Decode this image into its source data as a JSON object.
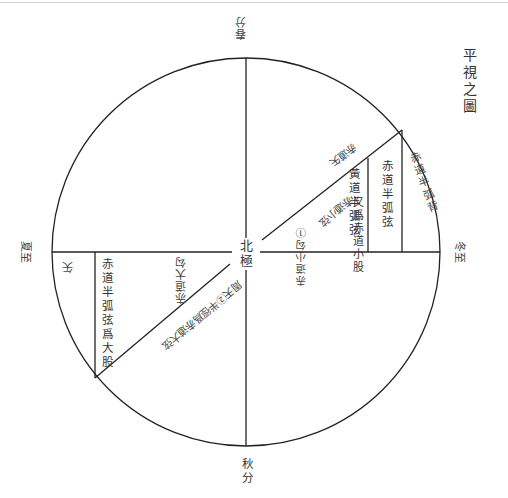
{
  "title": "平視之圖",
  "cardinal": {
    "top": "春分",
    "bottom": "秋分",
    "left": "夏至",
    "right": "冬至"
  },
  "center_label": "北極",
  "labels": {
    "chidao_banhu_bei": "赤道半弧背",
    "chidao_banhu_xian": "赤道半弧弦",
    "huangdao_banhu_xian": "黃道半弧弦",
    "you_wei_chidao_xiao_gu": "又爲赤道小股",
    "chidao_xiao_gou": "赤道小勾①",
    "chidao_xiao_xian": "赤道小弦",
    "shi_top": "赤道矢",
    "shi_left": "矢",
    "chidao_banhu_xian_wei_da_gu": "赤道半弧弦爲大股",
    "chidao_da_gou": "赤道大勾",
    "zhoutian_banjing": "周天②半徑爲赤道大弦"
  },
  "geometry": {
    "center": [
      246,
      252
    ],
    "radius": 194,
    "stroke_color": "#222222"
  }
}
